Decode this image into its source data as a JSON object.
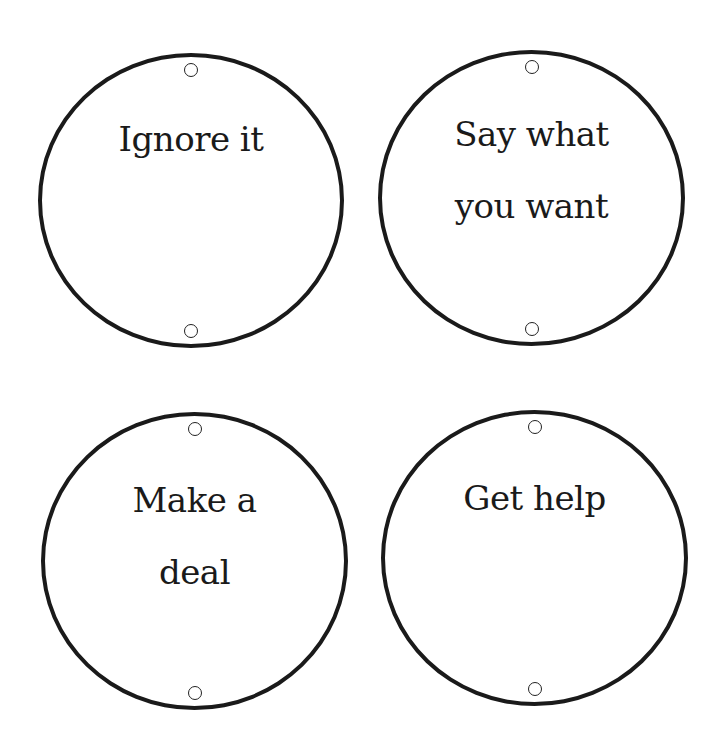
{
  "cards": [
    {
      "id": "ignore-it",
      "label": "Ignore it",
      "lines": [
        "Ignore it"
      ],
      "position": {
        "left": 38,
        "top": 53,
        "width": 306,
        "height": 295
      }
    },
    {
      "id": "say-what-you-want",
      "label": "Say what you want",
      "lines": [
        "Say what",
        "you want"
      ],
      "position": {
        "left": 378,
        "top": 50,
        "width": 307,
        "height": 296
      }
    },
    {
      "id": "make-a-deal",
      "label": "Make a deal",
      "lines": [
        "Make a",
        "deal"
      ],
      "position": {
        "left": 41,
        "top": 412,
        "width": 307,
        "height": 298
      }
    },
    {
      "id": "get-help",
      "label": "Get help",
      "lines": [
        "Get help"
      ],
      "position": {
        "left": 381,
        "top": 410,
        "width": 307,
        "height": 296
      }
    }
  ],
  "colors": {
    "background": "#ffffff",
    "stroke": "#1a1a1a",
    "text": "#1a1a1a"
  }
}
